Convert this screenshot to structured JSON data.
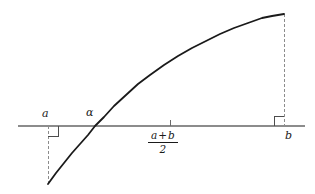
{
  "figure": {
    "title": "",
    "colors": {
      "curve": "#1a1a1a",
      "axis": "#8c8c8c",
      "dashed": "#8c8c8c",
      "angle_marker": "#4d4d4d",
      "tick": "#6a6a6a",
      "text": "#1a1a1a",
      "background": "#ffffff"
    },
    "labels": {
      "point_a": "a",
      "root_alpha": "α",
      "point_b": "b",
      "midpoint_numerator_left": "a",
      "midpoint_operator": "+",
      "midpoint_numerator_right": "b",
      "midpoint_denominator": "2"
    }
  },
  "chart_data": {
    "type": "line",
    "title": "",
    "xlabel": "",
    "ylabel": "",
    "xlim": [
      18,
      305
    ],
    "ylim": [
      194,
      0
    ],
    "grid": false,
    "legend": false,
    "axis": {
      "name": "horizontal-axis",
      "y_pixel": 126,
      "x_start": 18,
      "x_end": 305
    },
    "markers": [
      {
        "name": "a",
        "label": "a",
        "x": 48,
        "axis_y": 126,
        "curve_y": 184
      },
      {
        "name": "alpha",
        "label": "α",
        "x": 95,
        "axis_y": 126,
        "curve_y": 126
      },
      {
        "name": "midpoint",
        "label": "(a+b)/2",
        "x": 170,
        "axis_y": 126,
        "tick": true
      },
      {
        "name": "b",
        "label": "b",
        "x": 284,
        "axis_y": 126,
        "curve_y": 14
      }
    ],
    "dashed_segments": [
      {
        "name": "dashed-at-a",
        "x": 48,
        "y_top": 126,
        "y_bottom": 184
      },
      {
        "name": "dashed-at-b",
        "x": 284,
        "y_top": 14,
        "y_bottom": 126
      }
    ],
    "right_angle_markers": [
      {
        "name": "right-angle-at-a",
        "x": 48,
        "y": 126,
        "dx": 10,
        "dy": 10
      },
      {
        "name": "right-angle-at-b",
        "x": 284,
        "y": 126,
        "dx": -10,
        "dy": -10
      }
    ],
    "curve": {
      "name": "function-curve",
      "x": [
        48,
        56,
        64,
        72,
        80,
        88,
        95,
        104,
        114,
        126,
        138,
        150,
        164,
        178,
        192,
        206,
        220,
        234,
        248,
        262,
        272,
        284
      ],
      "y": [
        184,
        173,
        163,
        153,
        144,
        135,
        126,
        117,
        106,
        95,
        84,
        75,
        65,
        56,
        48,
        41,
        34,
        28,
        23,
        18,
        16,
        14
      ]
    }
  }
}
